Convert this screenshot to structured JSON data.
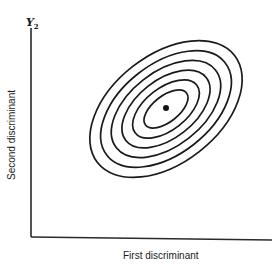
{
  "figure": {
    "y_axis_symbol": "Y",
    "y_axis_subscript": "2",
    "y_axis_label": "Second discriminant",
    "x_axis_label": "First discriminant",
    "colors": {
      "ink": "#1a1a1a",
      "background": "#ffffff"
    }
  },
  "diagram": {
    "type": "concentric-ellipses",
    "ellipse_count": 6,
    "center": [
      166,
      109
    ],
    "rotation_deg": -38,
    "ellipses": [
      {
        "rx": 87,
        "ry": 54
      },
      {
        "rx": 75,
        "ry": 45
      },
      {
        "rx": 63,
        "ry": 37
      },
      {
        "rx": 51,
        "ry": 29
      },
      {
        "rx": 39,
        "ry": 21
      },
      {
        "rx": 26,
        "ry": 13
      }
    ],
    "center_point": true
  }
}
